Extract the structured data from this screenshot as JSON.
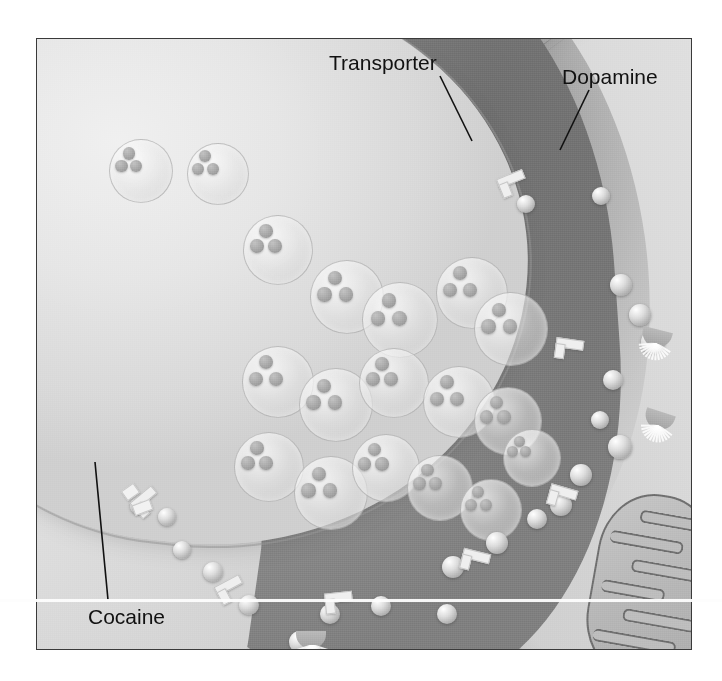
{
  "figure": {
    "border_color": "#3a3a3a",
    "background_color": "#cfcfcf"
  },
  "labels": [
    {
      "id": "transporter",
      "text": "Transporter",
      "x": 329,
      "y": 52,
      "leader": {
        "x1": 440,
        "y1": 76,
        "x2": 472,
        "y2": 141
      }
    },
    {
      "id": "dopamine",
      "text": "Dopamine",
      "x": 562,
      "y": 66,
      "leader": {
        "x1": 589,
        "y1": 90,
        "x2": 560,
        "y2": 150
      }
    },
    {
      "id": "cocaine",
      "text": "Cocaine",
      "x": 88,
      "y": 606,
      "leader": {
        "x1": 108,
        "y1": 600,
        "x2": 95,
        "y2": 462
      }
    }
  ],
  "structures": {
    "presynaptic_terminal": "presynaptic-terminal",
    "postsynaptic_cell": "postsynaptic-cell",
    "synaptic_cleft": "synaptic-cleft",
    "mitochondrion": "mitochondrion",
    "axon": "axon"
  },
  "vesicles": [
    {
      "x": 72,
      "y": 100,
      "r": 31,
      "dots": [
        [
          14,
          8
        ],
        [
          6,
          22
        ],
        [
          22,
          22
        ]
      ]
    },
    {
      "x": 150,
      "y": 104,
      "r": 30,
      "dots": [
        [
          13,
          7
        ],
        [
          5,
          21
        ],
        [
          21,
          21
        ]
      ]
    },
    {
      "x": 206,
      "y": 176,
      "r": 34,
      "dots": [
        [
          15,
          8
        ],
        [
          6,
          23
        ],
        [
          24,
          23
        ]
      ]
    },
    {
      "x": 273,
      "y": 221,
      "r": 36,
      "dots": [
        [
          16,
          9
        ],
        [
          6,
          25
        ],
        [
          26,
          25
        ]
      ]
    },
    {
      "x": 325,
      "y": 243,
      "r": 37,
      "dots": [
        [
          17,
          9
        ],
        [
          7,
          26
        ],
        [
          27,
          26
        ]
      ]
    },
    {
      "x": 399,
      "y": 218,
      "r": 35,
      "dots": [
        [
          16,
          8
        ],
        [
          6,
          24
        ],
        [
          25,
          24
        ]
      ]
    },
    {
      "x": 437,
      "y": 253,
      "r": 36,
      "dots": [
        [
          16,
          9
        ],
        [
          6,
          25
        ],
        [
          26,
          25
        ]
      ]
    },
    {
      "x": 205,
      "y": 307,
      "r": 35,
      "dots": [
        [
          16,
          8
        ],
        [
          6,
          24
        ],
        [
          25,
          24
        ]
      ]
    },
    {
      "x": 262,
      "y": 329,
      "r": 36,
      "dots": [
        [
          16,
          9
        ],
        [
          6,
          25
        ],
        [
          26,
          25
        ]
      ]
    },
    {
      "x": 322,
      "y": 309,
      "r": 34,
      "dots": [
        [
          15,
          8
        ],
        [
          6,
          23
        ],
        [
          24,
          23
        ]
      ]
    },
    {
      "x": 386,
      "y": 327,
      "r": 35,
      "dots": [
        [
          16,
          8
        ],
        [
          6,
          24
        ],
        [
          25,
          24
        ]
      ]
    },
    {
      "x": 437,
      "y": 348,
      "r": 33,
      "dots": [
        [
          15,
          8
        ],
        [
          5,
          23
        ],
        [
          23,
          23
        ]
      ]
    },
    {
      "x": 197,
      "y": 393,
      "r": 34,
      "dots": [
        [
          15,
          8
        ],
        [
          6,
          23
        ],
        [
          24,
          23
        ]
      ]
    },
    {
      "x": 257,
      "y": 417,
      "r": 36,
      "dots": [
        [
          16,
          9
        ],
        [
          6,
          25
        ],
        [
          26,
          25
        ]
      ]
    },
    {
      "x": 315,
      "y": 395,
      "r": 33,
      "dots": [
        [
          15,
          8
        ],
        [
          5,
          23
        ],
        [
          23,
          23
        ]
      ]
    },
    {
      "x": 370,
      "y": 416,
      "r": 32,
      "dots": [
        [
          14,
          8
        ],
        [
          5,
          22
        ],
        [
          22,
          22
        ]
      ]
    },
    {
      "x": 423,
      "y": 440,
      "r": 30,
      "dots": [
        [
          13,
          7
        ],
        [
          5,
          21
        ],
        [
          21,
          21
        ]
      ]
    },
    {
      "x": 466,
      "y": 390,
      "r": 28,
      "dots": [
        [
          12,
          7
        ],
        [
          4,
          19
        ],
        [
          19,
          19
        ]
      ]
    }
  ],
  "dopamine_spheres": [
    {
      "x": 555,
      "y": 148,
      "r": 9
    },
    {
      "x": 573,
      "y": 235,
      "r": 11
    },
    {
      "x": 592,
      "y": 265,
      "r": 11
    },
    {
      "x": 604,
      "y": 291,
      "r": 12
    },
    {
      "x": 566,
      "y": 331,
      "r": 10
    },
    {
      "x": 554,
      "y": 372,
      "r": 9
    },
    {
      "x": 571,
      "y": 396,
      "r": 12
    },
    {
      "x": 533,
      "y": 425,
      "r": 11
    },
    {
      "x": 513,
      "y": 455,
      "r": 11
    },
    {
      "x": 490,
      "y": 470,
      "r": 10
    },
    {
      "x": 449,
      "y": 493,
      "r": 11
    },
    {
      "x": 405,
      "y": 517,
      "r": 11
    },
    {
      "x": 400,
      "y": 565,
      "r": 10
    },
    {
      "x": 334,
      "y": 557,
      "r": 10
    },
    {
      "x": 283,
      "y": 565,
      "r": 10
    },
    {
      "x": 252,
      "y": 592,
      "r": 11
    },
    {
      "x": 202,
      "y": 556,
      "r": 10
    },
    {
      "x": 166,
      "y": 523,
      "r": 10
    },
    {
      "x": 136,
      "y": 502,
      "r": 9
    },
    {
      "x": 121,
      "y": 469,
      "r": 9
    },
    {
      "x": 93,
      "y": 459,
      "r": 8
    },
    {
      "x": 480,
      "y": 156,
      "r": 9
    }
  ],
  "transporters": [
    {
      "x": 462,
      "y": 134,
      "rot": -22
    },
    {
      "x": 518,
      "y": 300,
      "rot": 8
    },
    {
      "x": 511,
      "y": 448,
      "rot": 16
    },
    {
      "x": 424,
      "y": 512,
      "rot": 14
    },
    {
      "x": 288,
      "y": 553,
      "rot": -6
    },
    {
      "x": 180,
      "y": 540,
      "rot": -28
    },
    {
      "x": 96,
      "y": 452,
      "rot": -40
    }
  ],
  "cocaine_blocks": [
    {
      "x": 86,
      "y": 447,
      "w": 13,
      "h": 10,
      "rot": -35
    },
    {
      "x": 96,
      "y": 463,
      "w": 17,
      "h": 9,
      "rot": -20
    }
  ],
  "receptors": [
    {
      "x": 592,
      "y": 372,
      "rot": 18
    },
    {
      "x": 247,
      "y": 592,
      "rot": 0
    },
    {
      "x": 590,
      "y": 290,
      "rot": 14
    }
  ],
  "mitochondrion": {
    "cristae_count": 6,
    "label": "mitochondrion"
  },
  "colors": {
    "ink": "#111111",
    "terminal_light": "#e6e6e6",
    "cleft_dark": "#8a8a8a",
    "postsynaptic": "#dcdcdc",
    "membrane": "#9a9a9a",
    "protein_light": "#efefef",
    "frame": "#3a3a3a"
  }
}
